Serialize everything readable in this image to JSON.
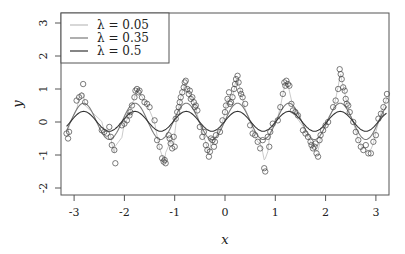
{
  "chart_data": {
    "type": "scatter",
    "title": "",
    "xlabel": "x",
    "ylabel": "y",
    "xlim": [
      -3.3,
      3.25
    ],
    "ylim": [
      -2.2,
      3.0
    ],
    "xticks": [
      -3,
      -2,
      -1,
      0,
      1,
      2,
      3
    ],
    "yticks": [
      -2,
      -1,
      0,
      1,
      2,
      3
    ],
    "grid": false,
    "legend_position": "top-left",
    "legend": [
      {
        "label": "λ = 0.05",
        "color": "#bdbdbd"
      },
      {
        "label": "λ = 0.35",
        "color": "#7a7a7a"
      },
      {
        "label": "λ = 0.5",
        "color": "#333333"
      }
    ],
    "points": [
      [
        -3.15,
        -0.35
      ],
      [
        -3.12,
        -0.5
      ],
      [
        -3.1,
        -0.3
      ],
      [
        -2.95,
        0.65
      ],
      [
        -2.9,
        0.75
      ],
      [
        -2.85,
        0.8
      ],
      [
        -2.82,
        1.15
      ],
      [
        -2.78,
        0.6
      ],
      [
        -2.45,
        -0.25
      ],
      [
        -2.4,
        -0.3
      ],
      [
        -2.35,
        -0.35
      ],
      [
        -2.3,
        -0.15
      ],
      [
        -2.27,
        -0.45
      ],
      [
        -2.25,
        -0.7
      ],
      [
        -2.2,
        -0.85
      ],
      [
        -2.18,
        -1.25
      ],
      [
        -2.05,
        -0.1
      ],
      [
        -2.0,
        -0.05
      ],
      [
        -1.95,
        0.05
      ],
      [
        -1.9,
        0.2
      ],
      [
        -1.88,
        0.3
      ],
      [
        -1.85,
        0.5
      ],
      [
        -1.8,
        0.75
      ],
      [
        -1.78,
        0.95
      ],
      [
        -1.75,
        1.0
      ],
      [
        -1.72,
        0.9
      ],
      [
        -1.7,
        0.95
      ],
      [
        -1.65,
        0.75
      ],
      [
        -1.6,
        0.6
      ],
      [
        -1.55,
        0.55
      ],
      [
        -1.5,
        0.45
      ],
      [
        -1.4,
        0.05
      ],
      [
        -1.35,
        -0.55
      ],
      [
        -1.3,
        -0.75
      ],
      [
        -1.25,
        -1.1
      ],
      [
        -1.22,
        -1.2
      ],
      [
        -1.2,
        -1.15
      ],
      [
        -1.18,
        -1.25
      ],
      [
        -1.12,
        -0.4
      ],
      [
        -1.1,
        -0.5
      ],
      [
        -1.08,
        -0.65
      ],
      [
        -1.05,
        -0.8
      ],
      [
        -1.02,
        -0.45
      ],
      [
        -1.0,
        -0.75
      ],
      [
        -0.98,
        0.1
      ],
      [
        -0.95,
        0.3
      ],
      [
        -0.92,
        0.45
      ],
      [
        -0.9,
        0.6
      ],
      [
        -0.88,
        0.75
      ],
      [
        -0.85,
        0.9
      ],
      [
        -0.82,
        1.05
      ],
      [
        -0.8,
        1.2
      ],
      [
        -0.78,
        1.25
      ],
      [
        -0.75,
        1.0
      ],
      [
        -0.72,
        0.85
      ],
      [
        -0.7,
        0.95
      ],
      [
        -0.68,
        0.7
      ],
      [
        -0.65,
        0.75
      ],
      [
        -0.62,
        0.6
      ],
      [
        -0.6,
        0.45
      ],
      [
        -0.58,
        0.5
      ],
      [
        -0.55,
        0.35
      ],
      [
        -0.5,
        -0.15
      ],
      [
        -0.45,
        -0.45
      ],
      [
        -0.42,
        -0.3
      ],
      [
        -0.38,
        -0.7
      ],
      [
        -0.35,
        -0.85
      ],
      [
        -0.32,
        -1.05
      ],
      [
        -0.3,
        -0.9
      ],
      [
        -0.28,
        -0.5
      ],
      [
        -0.25,
        -0.55
      ],
      [
        -0.22,
        -0.75
      ],
      [
        -0.2,
        -0.6
      ],
      [
        -0.18,
        -0.4
      ],
      [
        -0.1,
        -0.3
      ],
      [
        -0.05,
        0.05
      ],
      [
        0.0,
        0.3
      ],
      [
        0.02,
        0.5
      ],
      [
        0.05,
        0.7
      ],
      [
        0.08,
        0.9
      ],
      [
        0.1,
        0.55
      ],
      [
        0.12,
        0.6
      ],
      [
        0.15,
        0.75
      ],
      [
        0.18,
        1.0
      ],
      [
        0.2,
        1.15
      ],
      [
        0.22,
        1.3
      ],
      [
        0.25,
        1.4
      ],
      [
        0.27,
        1.2
      ],
      [
        0.3,
        0.95
      ],
      [
        0.32,
        0.85
      ],
      [
        0.35,
        0.75
      ],
      [
        0.4,
        0.55
      ],
      [
        0.5,
        -0.1
      ],
      [
        0.55,
        -0.35
      ],
      [
        0.6,
        -0.4
      ],
      [
        0.65,
        -0.6
      ],
      [
        0.7,
        -0.8
      ],
      [
        0.75,
        -0.55
      ],
      [
        0.78,
        -1.4
      ],
      [
        0.8,
        -1.5
      ],
      [
        0.85,
        -0.45
      ],
      [
        0.88,
        -0.75
      ],
      [
        0.9,
        -0.3
      ],
      [
        0.95,
        -0.05
      ],
      [
        1.05,
        0.05
      ],
      [
        1.1,
        0.45
      ],
      [
        1.15,
        0.85
      ],
      [
        1.18,
        1.2
      ],
      [
        1.2,
        1.1
      ],
      [
        1.22,
        1.25
      ],
      [
        1.25,
        1.15
      ],
      [
        1.28,
        1.1
      ],
      [
        1.32,
        0.55
      ],
      [
        1.35,
        0.35
      ],
      [
        1.4,
        0.3
      ],
      [
        1.45,
        0.2
      ],
      [
        1.55,
        -0.25
      ],
      [
        1.6,
        -0.35
      ],
      [
        1.65,
        -0.45
      ],
      [
        1.7,
        -0.6
      ],
      [
        1.72,
        -0.7
      ],
      [
        1.75,
        -0.8
      ],
      [
        1.78,
        -0.75
      ],
      [
        1.8,
        -0.65
      ],
      [
        1.82,
        -0.95
      ],
      [
        1.85,
        -1.05
      ],
      [
        1.88,
        -0.55
      ],
      [
        1.9,
        -0.4
      ],
      [
        1.95,
        -0.25
      ],
      [
        2.0,
        -0.1
      ],
      [
        2.05,
        0.0
      ],
      [
        2.15,
        0.45
      ],
      [
        2.2,
        0.65
      ],
      [
        2.25,
        1.0
      ],
      [
        2.28,
        1.6
      ],
      [
        2.3,
        1.45
      ],
      [
        2.32,
        1.3
      ],
      [
        2.35,
        1.05
      ],
      [
        2.38,
        0.95
      ],
      [
        2.4,
        0.7
      ],
      [
        2.42,
        0.55
      ],
      [
        2.45,
        0.5
      ],
      [
        2.48,
        0.3
      ],
      [
        2.55,
        0.0
      ],
      [
        2.6,
        -0.3
      ],
      [
        2.65,
        -0.55
      ],
      [
        2.7,
        -0.75
      ],
      [
        2.75,
        -0.85
      ],
      [
        2.8,
        -0.7
      ],
      [
        2.85,
        -0.95
      ],
      [
        2.9,
        -0.95
      ],
      [
        2.95,
        -0.6
      ],
      [
        3.0,
        -0.4
      ],
      [
        3.05,
        0.1
      ],
      [
        3.1,
        0.25
      ],
      [
        3.15,
        0.45
      ],
      [
        3.2,
        0.65
      ],
      [
        3.22,
        0.85
      ]
    ],
    "series": [
      {
        "name": "λ = 0.05",
        "color": "#bdbdbd",
        "amplitude": 1.05,
        "phase_peak": 0.25,
        "period": 1.02
      },
      {
        "name": "λ = 0.35",
        "color": "#7a7a7a",
        "amplitude": 0.55,
        "phase_peak": 0.25,
        "period": 1.02
      },
      {
        "name": "λ = 0.5",
        "color": "#333333",
        "amplitude": 0.3,
        "phase_peak": 0.25,
        "period": 1.02
      }
    ]
  }
}
